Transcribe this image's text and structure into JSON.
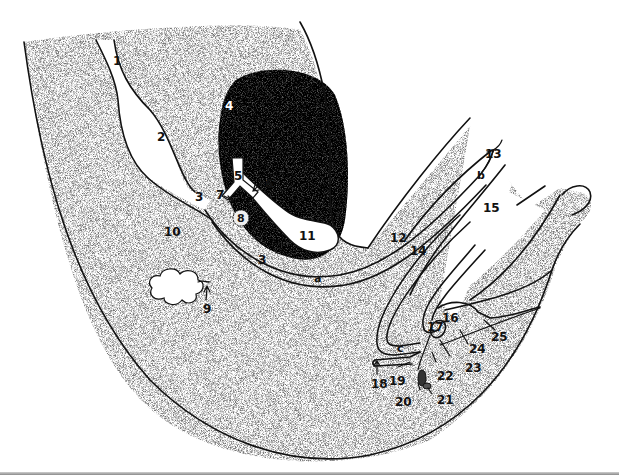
{
  "figure": {
    "type": "anatomical-sagittal-section",
    "background_color": "#ffffff",
    "tissue_stipple_color": "#b8b8b8",
    "dense_organ_color": "#3a3a3a",
    "outline_color": "#111111"
  },
  "labels": {
    "n1": "1",
    "n2": "2",
    "n3a": "3",
    "n3b": "3",
    "n4": "4",
    "n5": "5",
    "n6": "6",
    "n7": "7",
    "n8": "8",
    "n9": "9",
    "n10": "10",
    "n11": "11",
    "n12": "12",
    "n13": "13",
    "n14": "14",
    "n15": "15",
    "n16": "16",
    "n17": "17",
    "n18": "18",
    "n19": "19",
    "n20": "20",
    "n21": "21",
    "n22": "22",
    "n23": "23",
    "n24": "24",
    "n25": "25",
    "la": "a",
    "lb": "b",
    "lc": "c"
  }
}
